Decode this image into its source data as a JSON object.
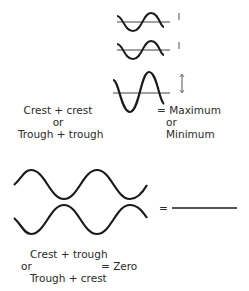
{
  "constructive": {
    "label_line1": "Crest + crest",
    "label_or": "or",
    "label_line2": "Trough  + trough",
    "result_eq": "= Maximum",
    "result_or": "or",
    "result_min": "Minimum"
  },
  "destructive": {
    "equals": "=",
    "label_line1": "Crest + trough",
    "label_or": "or",
    "label_line2": "Trough  + crest",
    "result": "= Zero"
  },
  "colors": {
    "stroke": "#1a1a1a",
    "axis": "#444444",
    "background": "#ffffff"
  }
}
